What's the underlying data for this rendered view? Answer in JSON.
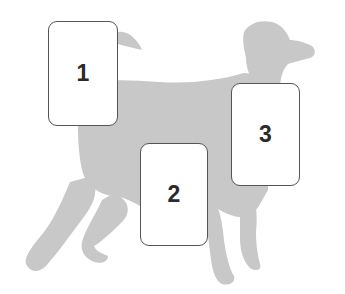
{
  "figure": {
    "silhouette_color": "#c8c8c8",
    "labels": [
      {
        "id": "1",
        "text": "1"
      },
      {
        "id": "2",
        "text": "2"
      },
      {
        "id": "3",
        "text": "3"
      }
    ]
  }
}
